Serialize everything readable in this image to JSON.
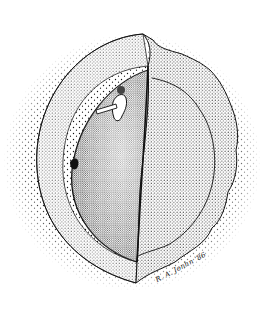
{
  "illustration": {
    "subject": "stippled pen-and-ink drawing of a bivalve shell within a circular vignette",
    "style": "stipple",
    "colors": {
      "ink": "#111111",
      "paper": "#ffffff"
    },
    "signature": "R. A. Jonhn '86"
  }
}
